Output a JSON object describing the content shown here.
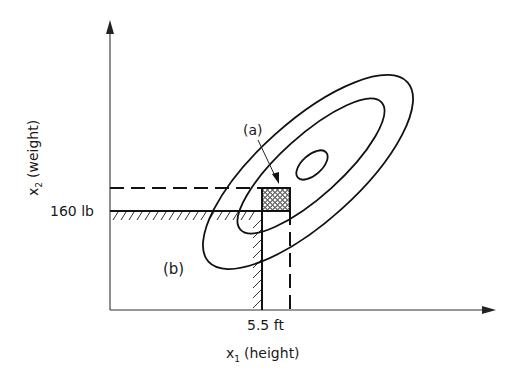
{
  "figure": {
    "axes": {
      "y_label_var": "x",
      "y_label_sub": "2",
      "y_label_text": "(weight)",
      "x_label_var": "x",
      "x_label_sub": "1",
      "x_label_text": "(height)"
    },
    "ticks": {
      "weight_value": "160 lb",
      "height_value": "5.5 ft"
    },
    "annotations": {
      "a": "(a)",
      "b": "(b)"
    }
  }
}
